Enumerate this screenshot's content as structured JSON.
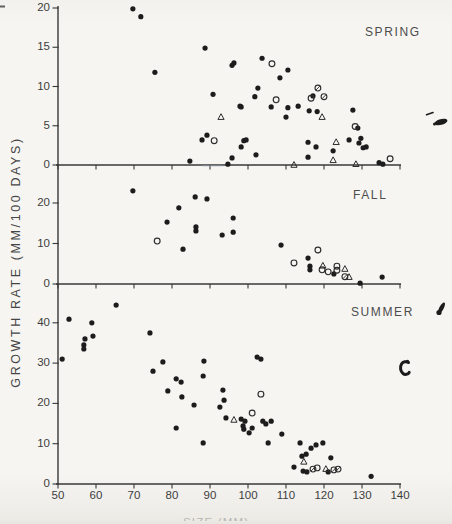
{
  "figure": {
    "ylabel": "GROWTH RATE (MM/100 DAYS)",
    "xlabel": "SIZE (MM)",
    "marker_key": {
      "f": "filled-circle",
      "o": "open-circle",
      "t": "open-triangle",
      "s": "slashed-circle"
    },
    "colors": {
      "ink": "#1c1c1c",
      "axis": "#383838",
      "paper": "#f6f5f2",
      "blue_scan_tint": "#9fb0c6"
    }
  },
  "axes": {
    "x": {
      "min": 50,
      "max": 140,
      "ticks": [
        50,
        60,
        70,
        80,
        90,
        100,
        110,
        120,
        130,
        140
      ]
    }
  },
  "chart_data": [
    {
      "type": "scatter",
      "title": "SPRING",
      "xlabel": "SIZE (MM)",
      "ylabel": "GROWTH RATE (MM/100 DAYS)",
      "xlim": [
        50,
        140
      ],
      "ylim": [
        0,
        20
      ],
      "yticks": [
        0,
        5,
        10,
        15,
        20
      ],
      "grid": false,
      "points": [
        [
          69.7,
          19.9,
          "f"
        ],
        [
          71.8,
          18.9,
          "f"
        ],
        [
          88.7,
          14.9,
          "f"
        ],
        [
          75.5,
          11.8,
          "f"
        ],
        [
          95.8,
          12.7,
          "f"
        ],
        [
          96.3,
          13.0,
          "f"
        ],
        [
          103.7,
          13.6,
          "f"
        ],
        [
          110.5,
          12.1,
          "f"
        ],
        [
          108.4,
          11.1,
          "f"
        ],
        [
          90.8,
          9.0,
          "f"
        ],
        [
          102.6,
          9.8,
          "f"
        ],
        [
          101.8,
          8.7,
          "f"
        ],
        [
          117.1,
          8.8,
          "f"
        ],
        [
          98.2,
          7.4,
          "f"
        ],
        [
          97.9,
          7.5,
          "f"
        ],
        [
          106.1,
          7.4,
          "f"
        ],
        [
          110.5,
          7.3,
          "f"
        ],
        [
          113.2,
          7.5,
          "f"
        ],
        [
          116.1,
          6.9,
          "f"
        ],
        [
          118.2,
          6.8,
          "f"
        ],
        [
          110.0,
          6.1,
          "f"
        ],
        [
          127.6,
          7.0,
          "f"
        ],
        [
          128.9,
          4.7,
          "f"
        ],
        [
          129.7,
          3.4,
          "f"
        ],
        [
          131.1,
          2.3,
          "f"
        ],
        [
          89.2,
          3.8,
          "f"
        ],
        [
          87.9,
          3.2,
          "f"
        ],
        [
          98.9,
          3.1,
          "f"
        ],
        [
          99.5,
          3.2,
          "f"
        ],
        [
          98.2,
          2.3,
          "f"
        ],
        [
          102.1,
          1.3,
          "f"
        ],
        [
          115.8,
          2.9,
          "f"
        ],
        [
          117.9,
          2.3,
          "f"
        ],
        [
          126.6,
          3.2,
          "f"
        ],
        [
          129.2,
          2.8,
          "f"
        ],
        [
          130.3,
          2.2,
          "f"
        ],
        [
          84.7,
          0.5,
          "f"
        ],
        [
          95.8,
          0.9,
          "f"
        ],
        [
          94.7,
          0.1,
          "f"
        ],
        [
          115.8,
          1.0,
          "f"
        ],
        [
          122.4,
          1.8,
          "f"
        ],
        [
          134.5,
          0.3,
          "f"
        ],
        [
          135.5,
          0.1,
          "f"
        ],
        [
          91.1,
          3.1,
          "o"
        ],
        [
          106.3,
          12.9,
          "o"
        ],
        [
          116.6,
          8.5,
          "o"
        ],
        [
          107.4,
          8.3,
          "o"
        ],
        [
          128.2,
          4.9,
          "o"
        ],
        [
          137.4,
          0.8,
          "o"
        ],
        [
          92.9,
          6.1,
          "t"
        ],
        [
          119.5,
          6.1,
          "t"
        ],
        [
          123.2,
          2.9,
          "t"
        ],
        [
          122.4,
          0.6,
          "t"
        ],
        [
          128.4,
          0.1,
          "t"
        ],
        [
          112.1,
          0.0,
          "t"
        ],
        [
          118.4,
          9.8,
          "s"
        ],
        [
          120.0,
          8.7,
          "s"
        ]
      ]
    },
    {
      "type": "scatter",
      "title": "FALL",
      "xlabel": "SIZE (MM)",
      "ylabel": "GROWTH RATE (MM/100 DAYS)",
      "xlim": [
        50,
        140
      ],
      "ylim": [
        0,
        25
      ],
      "yticks": [
        0,
        10,
        20
      ],
      "grid": false,
      "points": [
        [
          69.7,
          23.0,
          "f"
        ],
        [
          86.1,
          21.5,
          "f"
        ],
        [
          89.2,
          21.0,
          "f"
        ],
        [
          81.8,
          18.8,
          "f"
        ],
        [
          78.7,
          15.3,
          "f"
        ],
        [
          96.1,
          16.3,
          "f"
        ],
        [
          86.3,
          14.1,
          "f"
        ],
        [
          86.3,
          13.1,
          "f"
        ],
        [
          96.1,
          12.8,
          "f"
        ],
        [
          93.2,
          12.1,
          "f"
        ],
        [
          82.9,
          8.6,
          "f"
        ],
        [
          108.7,
          9.6,
          "f"
        ],
        [
          115.8,
          6.4,
          "f"
        ],
        [
          116.3,
          4.4,
          "f"
        ],
        [
          116.3,
          3.5,
          "f"
        ],
        [
          122.6,
          2.5,
          "f"
        ],
        [
          129.5,
          0.2,
          "f"
        ],
        [
          135.3,
          1.7,
          "f"
        ],
        [
          76.1,
          10.6,
          "o"
        ],
        [
          118.4,
          8.4,
          "o"
        ],
        [
          112.1,
          5.2,
          "o"
        ],
        [
          119.5,
          3.5,
          "o"
        ],
        [
          123.4,
          4.4,
          "o"
        ],
        [
          123.4,
          3.4,
          "o"
        ],
        [
          121.1,
          3.0,
          "o"
        ],
        [
          119.7,
          4.5,
          "t"
        ],
        [
          125.5,
          3.7,
          "t"
        ],
        [
          126.6,
          1.7,
          "t"
        ],
        [
          125.5,
          1.8,
          "s"
        ]
      ]
    },
    {
      "type": "scatter",
      "title": "SUMMER",
      "xlabel": "SIZE (MM)",
      "ylabel": "GROWTH RATE (MM/100 DAYS)",
      "xlim": [
        50,
        140
      ],
      "ylim": [
        0,
        47
      ],
      "yticks": [
        0,
        10,
        20,
        30,
        40
      ],
      "grid": false,
      "points": [
        [
          65.3,
          44.4,
          "f"
        ],
        [
          52.9,
          40.9,
          "f"
        ],
        [
          58.9,
          40.0,
          "f"
        ],
        [
          59.2,
          36.7,
          "f"
        ],
        [
          57.1,
          36.0,
          "f"
        ],
        [
          56.8,
          34.5,
          "f"
        ],
        [
          56.8,
          33.5,
          "f"
        ],
        [
          51.1,
          31.0,
          "f"
        ],
        [
          74.2,
          37.5,
          "f"
        ],
        [
          77.6,
          30.3,
          "f"
        ],
        [
          75.0,
          28.0,
          "f"
        ],
        [
          88.4,
          30.5,
          "f"
        ],
        [
          88.2,
          26.8,
          "f"
        ],
        [
          81.1,
          26.1,
          "f"
        ],
        [
          82.4,
          25.3,
          "f"
        ],
        [
          78.9,
          23.1,
          "f"
        ],
        [
          82.6,
          21.6,
          "f"
        ],
        [
          85.8,
          19.6,
          "f"
        ],
        [
          93.4,
          23.3,
          "f"
        ],
        [
          93.7,
          20.8,
          "f"
        ],
        [
          92.6,
          19.1,
          "f"
        ],
        [
          94.2,
          16.4,
          "f"
        ],
        [
          81.1,
          13.9,
          "f"
        ],
        [
          88.2,
          10.2,
          "f"
        ],
        [
          102.4,
          31.5,
          "f"
        ],
        [
          103.4,
          31.0,
          "f"
        ],
        [
          98.2,
          16.1,
          "f"
        ],
        [
          99.2,
          15.6,
          "f"
        ],
        [
          98.7,
          14.4,
          "f"
        ],
        [
          98.9,
          13.6,
          "f"
        ],
        [
          101.1,
          13.9,
          "f"
        ],
        [
          100.3,
          12.7,
          "f"
        ],
        [
          103.9,
          15.6,
          "f"
        ],
        [
          104.7,
          14.9,
          "f"
        ],
        [
          106.1,
          15.6,
          "f"
        ],
        [
          105.3,
          10.2,
          "f"
        ],
        [
          108.9,
          12.4,
          "f"
        ],
        [
          113.7,
          10.2,
          "f"
        ],
        [
          117.9,
          9.7,
          "f"
        ],
        [
          119.7,
          10.2,
          "f"
        ],
        [
          116.6,
          8.9,
          "f"
        ],
        [
          114.2,
          6.9,
          "f"
        ],
        [
          115.3,
          7.4,
          "f"
        ],
        [
          121.8,
          6.5,
          "f"
        ],
        [
          112.1,
          4.2,
          "f"
        ],
        [
          114.5,
          3.2,
          "f"
        ],
        [
          115.5,
          3.0,
          "f"
        ],
        [
          121.1,
          3.0,
          "f"
        ],
        [
          132.4,
          1.9,
          "f"
        ],
        [
          103.4,
          22.3,
          "o"
        ],
        [
          101.1,
          17.6,
          "o"
        ],
        [
          118.2,
          4.0,
          "o"
        ],
        [
          96.3,
          15.9,
          "t"
        ],
        [
          114.7,
          5.5,
          "t"
        ],
        [
          120.5,
          3.7,
          "t"
        ],
        [
          117.1,
          3.7,
          "s"
        ],
        [
          122.6,
          3.5,
          "s"
        ],
        [
          123.7,
          3.7,
          "s"
        ]
      ]
    }
  ]
}
